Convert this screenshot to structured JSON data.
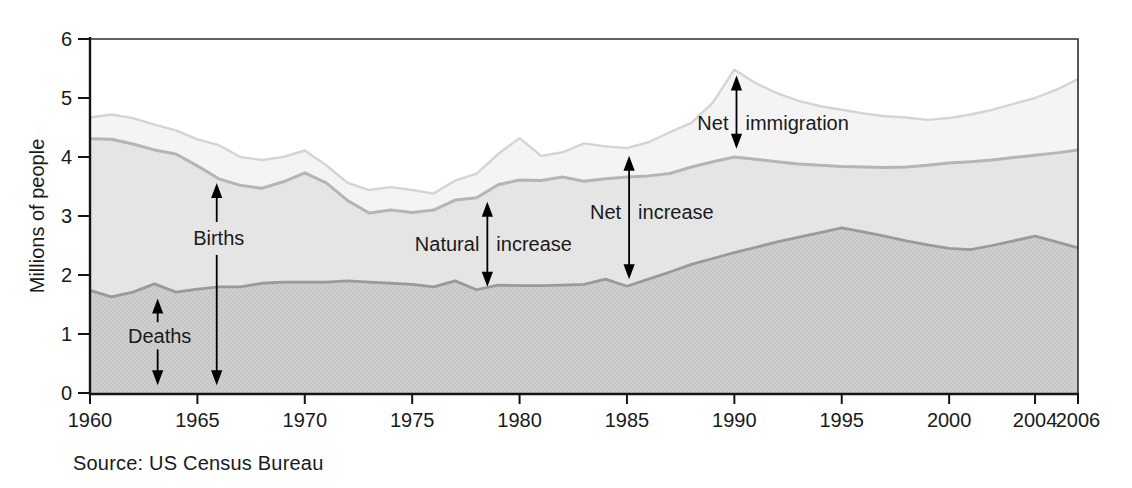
{
  "figure": {
    "y_axis_title": "Millions of people",
    "source": "Source: US Census Bureau"
  },
  "colors": {
    "background": "#ffffff",
    "frame_dark": "#141414",
    "frame_light": "#2e2e2e",
    "tick": "#141414",
    "text": "#1a1a1a",
    "arrow": "#000000",
    "deaths_area_base": "#cfcfcf",
    "deaths_area_dot": "#b9b9b9",
    "natural_area_base": "#e7e7e7",
    "natural_area_dot": "#dedede",
    "immigration_area_base": "#f5f5f5",
    "immigration_area_dot": "#f0f0f0",
    "deaths_line": "#9a9a9a",
    "births_line": "#b5b5b5",
    "total_line": "#d4d4d4"
  },
  "chart_data": {
    "type": "area",
    "title": "",
    "xlabel": "",
    "ylabel": "Millions of people",
    "source": "Source: US Census Bureau",
    "xlim": [
      1960,
      2006
    ],
    "ylim": [
      0,
      6
    ],
    "grid": false,
    "legend": "none (labels annotated on chart with arrows)",
    "y_ticks": [
      0,
      1,
      2,
      3,
      4,
      5,
      6
    ],
    "x_ticks": [
      1960,
      1965,
      1970,
      1975,
      1980,
      1985,
      1990,
      1995,
      2000,
      2004,
      2006
    ],
    "years": [
      1960,
      1961,
      1962,
      1963,
      1964,
      1965,
      1966,
      1967,
      1968,
      1969,
      1970,
      1971,
      1972,
      1973,
      1974,
      1975,
      1976,
      1977,
      1978,
      1979,
      1980,
      1981,
      1982,
      1983,
      1984,
      1985,
      1986,
      1987,
      1988,
      1989,
      1990,
      1991,
      1992,
      1993,
      1994,
      1995,
      1996,
      1997,
      1998,
      1999,
      2000,
      2001,
      2002,
      2003,
      2004,
      2005,
      2006
    ],
    "series": [
      {
        "name": "Deaths",
        "description": "bottom boundary line; area below is the deaths region",
        "values": [
          1.74,
          1.63,
          1.71,
          1.85,
          1.71,
          1.76,
          1.8,
          1.8,
          1.86,
          1.88,
          1.88,
          1.88,
          1.9,
          1.88,
          1.86,
          1.84,
          1.8,
          1.9,
          1.75,
          1.83,
          1.82,
          1.82,
          1.83,
          1.84,
          1.93,
          1.81,
          1.93,
          2.05,
          2.18,
          2.28,
          2.38,
          2.47,
          2.56,
          2.64,
          2.72,
          2.8,
          2.73,
          2.66,
          2.58,
          2.51,
          2.45,
          2.43,
          2.5,
          2.58,
          2.66,
          2.56,
          2.46
        ]
      },
      {
        "name": "Births",
        "description": "middle boundary line; band between Deaths and Births is the natural increase",
        "values": [
          4.31,
          4.3,
          4.22,
          4.12,
          4.05,
          3.85,
          3.63,
          3.52,
          3.47,
          3.58,
          3.73,
          3.56,
          3.26,
          3.05,
          3.1,
          3.06,
          3.1,
          3.27,
          3.31,
          3.53,
          3.61,
          3.6,
          3.66,
          3.59,
          3.63,
          3.66,
          3.68,
          3.72,
          3.83,
          3.92,
          4.0,
          3.96,
          3.92,
          3.88,
          3.86,
          3.84,
          3.83,
          3.82,
          3.83,
          3.86,
          3.9,
          3.92,
          3.95,
          3.99,
          4.03,
          4.07,
          4.12
        ]
      },
      {
        "name": "Births plus net immigration",
        "description": "top boundary line; band between Births and this line is net immigration; distance from Deaths to this line is net increase",
        "values": [
          4.67,
          4.72,
          4.66,
          4.55,
          4.45,
          4.3,
          4.2,
          4.0,
          3.95,
          4.0,
          4.11,
          3.86,
          3.56,
          3.44,
          3.49,
          3.44,
          3.38,
          3.6,
          3.72,
          4.05,
          4.32,
          4.02,
          4.08,
          4.23,
          4.18,
          4.15,
          4.25,
          4.42,
          4.58,
          4.92,
          5.48,
          5.25,
          5.08,
          4.95,
          4.86,
          4.8,
          4.74,
          4.69,
          4.67,
          4.63,
          4.66,
          4.72,
          4.8,
          4.9,
          5.0,
          5.14,
          5.32
        ]
      }
    ],
    "annotations": [
      {
        "name": "deaths",
        "label": "Deaths",
        "label_align": "center",
        "arrow_year": 1963.15,
        "label_value": 0.97,
        "segments": [
          {
            "v1": 1.2,
            "v2": 1.6,
            "head_top": true,
            "head_bottom": false
          },
          {
            "v1": 0.13,
            "v2": 0.74,
            "head_top": false,
            "head_bottom": true
          }
        ]
      },
      {
        "name": "births",
        "label": "Births",
        "label_align": "center",
        "arrow_year": 1965.9,
        "label_value": 2.62,
        "segments": [
          {
            "v1": 2.9,
            "v2": 3.56,
            "head_top": true,
            "head_bottom": false
          },
          {
            "v1": 0.13,
            "v2": 2.34,
            "head_top": false,
            "head_bottom": true
          }
        ]
      },
      {
        "name": "natural-increase",
        "label_left": "Natural",
        "label_right": "increase",
        "arrow_year": 1978.5,
        "label_value": 2.52,
        "segments": [
          {
            "v1": 1.8,
            "v2": 3.24,
            "head_top": true,
            "head_bottom": true
          }
        ]
      },
      {
        "name": "net-increase",
        "label_left": "Net",
        "label_right": "increase",
        "arrow_year": 1985.1,
        "label_value": 3.06,
        "segments": [
          {
            "v1": 1.93,
            "v2": 4.02,
            "head_top": true,
            "head_bottom": true
          }
        ]
      },
      {
        "name": "net-immigration",
        "label_left": "Net",
        "label_right": "immigration",
        "arrow_year": 1990.1,
        "label_value": 4.58,
        "segments": [
          {
            "v1": 4.14,
            "v2": 5.38,
            "head_top": true,
            "head_bottom": true
          }
        ]
      }
    ]
  }
}
